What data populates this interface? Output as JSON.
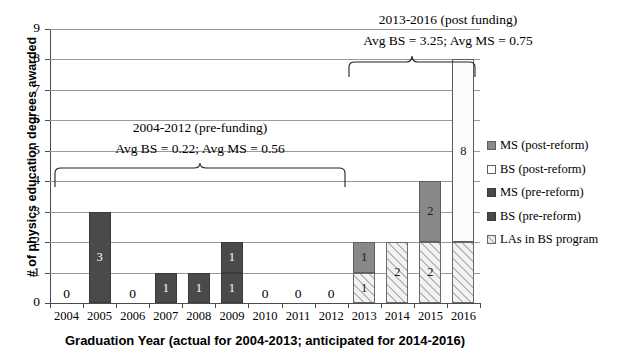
{
  "chart_data": {
    "type": "bar",
    "title": "",
    "xlabel": "Graduation Year (actual for 2004-2013; anticipated for 2014-2016)",
    "ylabel": "# of physics education degrees awarded",
    "ylim": [
      0,
      9
    ],
    "ytick_labels": [
      "0",
      "1",
      "2",
      "3",
      "4",
      "5",
      "6",
      "7",
      "8",
      "9"
    ],
    "grid": true,
    "stacked": true,
    "legend_position": "right",
    "categories": [
      "2004",
      "2005",
      "2006",
      "2007",
      "2008",
      "2009",
      "2010",
      "2011",
      "2012",
      "2013",
      "2014",
      "2015",
      "2016"
    ],
    "series": [
      {
        "name": "MS (post-reform)",
        "color": "#888888",
        "values": [
          0,
          0,
          0,
          0,
          0,
          0,
          0,
          0,
          0,
          1,
          0,
          2,
          0
        ]
      },
      {
        "name": "BS (post-reform)",
        "color": "#ffffff",
        "values": [
          0,
          0,
          0,
          0,
          0,
          0,
          0,
          0,
          0,
          0,
          0,
          0,
          8
        ]
      },
      {
        "name": "MS (pre-reform)",
        "color": "#4a4a4a",
        "values": [
          0,
          3,
          0,
          1,
          1,
          1,
          0,
          0,
          0,
          0,
          0,
          0,
          0
        ]
      },
      {
        "name": "BS (pre-reform)",
        "color": "#4a4a4a",
        "values": [
          0,
          0,
          0,
          0,
          0,
          1,
          0,
          0,
          0,
          0,
          0,
          0,
          0
        ]
      },
      {
        "name": "LAs in BS program",
        "color": "#f0f0f0",
        "values": [
          0,
          0,
          0,
          0,
          0,
          0,
          0,
          0,
          0,
          1,
          2,
          2,
          2
        ]
      }
    ],
    "bar_segments": [
      {
        "year": "2004",
        "segments": [],
        "zero_label": "0"
      },
      {
        "year": "2005",
        "segments": [
          {
            "series": "MS (pre-reform)",
            "value": 3,
            "label": "3"
          }
        ]
      },
      {
        "year": "2006",
        "segments": [],
        "zero_label": "0"
      },
      {
        "year": "2007",
        "segments": [
          {
            "series": "MS (pre-reform)",
            "value": 1,
            "label": "1"
          }
        ]
      },
      {
        "year": "2008",
        "segments": [
          {
            "series": "MS (pre-reform)",
            "value": 1,
            "label": "1"
          }
        ]
      },
      {
        "year": "2009",
        "segments": [
          {
            "series": "BS (pre-reform)",
            "value": 1,
            "label": "1"
          },
          {
            "series": "MS (pre-reform)",
            "value": 1,
            "label": "1"
          }
        ]
      },
      {
        "year": "2010",
        "segments": [],
        "zero_label": "0"
      },
      {
        "year": "2011",
        "segments": [],
        "zero_label": "0"
      },
      {
        "year": "2012",
        "segments": [],
        "zero_label": "0"
      },
      {
        "year": "2013",
        "segments": [
          {
            "series": "LAs in BS program",
            "value": 1,
            "label": "1"
          },
          {
            "series": "MS (post-reform)",
            "value": 1,
            "label": "1"
          }
        ]
      },
      {
        "year": "2014",
        "segments": [
          {
            "series": "LAs in BS program",
            "value": 2,
            "label": "2"
          }
        ]
      },
      {
        "year": "2015",
        "segments": [
          {
            "series": "LAs in BS program",
            "value": 2,
            "label": "2"
          },
          {
            "series": "MS (post-reform)",
            "value": 2,
            "label": "2"
          }
        ]
      },
      {
        "year": "2016",
        "segments": [
          {
            "series": "LAs in BS program",
            "value": 2,
            "label": ""
          },
          {
            "series": "BS (post-reform)",
            "value": 6,
            "label": "8"
          }
        ]
      }
    ],
    "annotations": [
      {
        "id": "pre_funding",
        "line1": "2004-2012 (pre-funding)",
        "line2": "Avg BS = 0.22; Avg MS = 0.56",
        "bracket": {
          "from": "2004",
          "to": "2012"
        }
      },
      {
        "id": "post_funding",
        "line1": "2013-2016 (post funding)",
        "line2": "Avg BS = 3.25; Avg MS = 0.75",
        "bracket": {
          "from": "2013",
          "to": "2016"
        }
      }
    ],
    "legend_entries": [
      {
        "label": "MS (post-reform)",
        "swatch": "sw-ms-post"
      },
      {
        "label": "BS (post-reform)",
        "swatch": "sw-bs-post"
      },
      {
        "label": "MS (pre-reform)",
        "swatch": "sw-ms-pre"
      },
      {
        "label": "BS (pre-reform)",
        "swatch": "sw-bs-pre"
      },
      {
        "label": "LAs in BS program",
        "swatch": "sw-la"
      }
    ]
  }
}
